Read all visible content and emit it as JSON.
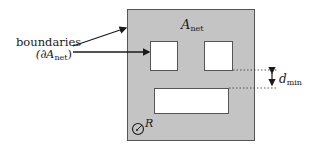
{
  "diagram": {
    "region_label": {
      "symbol": "A",
      "subscript": "net"
    },
    "boundaries_label": {
      "line1": "boundaries",
      "line2_prefix": "(∂",
      "line2_symbol": "A",
      "line2_subscript": "net",
      "line2_suffix": ")"
    },
    "distance_label": {
      "symbol": "d",
      "subscript": "min"
    },
    "radius_label": {
      "symbol": "R"
    },
    "colors": {
      "region_fill": "#c4c4c4",
      "region_border": "#555555",
      "hole_fill": "#ffffff",
      "line": "#1a1a1a"
    },
    "shapes": {
      "region": {
        "x": 127,
        "y": 9,
        "w": 128,
        "h": 132
      },
      "holes": [
        {
          "name": "hole-left",
          "x": 150,
          "y": 41,
          "w": 28,
          "h": 30
        },
        {
          "name": "hole-right",
          "x": 204,
          "y": 41,
          "w": 29,
          "h": 30
        },
        {
          "name": "hole-bottom",
          "x": 154,
          "y": 88,
          "w": 75,
          "h": 26
        }
      ]
    }
  }
}
